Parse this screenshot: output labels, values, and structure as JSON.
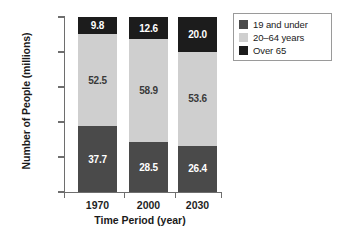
{
  "chart_data": {
    "type": "bar",
    "stacked": true,
    "title": "",
    "xlabel": "Time Period (year)",
    "ylabel": "Number of People (millions)",
    "categories": [
      "1970",
      "2000",
      "2030"
    ],
    "ylim": [
      0,
      100
    ],
    "yticks": [
      "0.0",
      "20.0",
      "40.0",
      "60.0",
      "80.0",
      "100.0"
    ],
    "ytick_values": [
      0,
      20,
      40,
      60,
      80,
      100
    ],
    "grid": false,
    "legend_position": "top-right",
    "series": [
      {
        "name": "19 and under",
        "color": "#4a4a4a",
        "label_color": "#ffffff",
        "values": [
          37.7,
          28.5,
          26.4
        ],
        "labels": [
          "37.7",
          "28.5",
          "26.4"
        ]
      },
      {
        "name": "20–64 years",
        "color": "#cfcfcf",
        "label_color": "#3a3a3a",
        "values": [
          52.5,
          58.9,
          53.6
        ],
        "labels": [
          "52.5",
          "58.9",
          "53.6"
        ]
      },
      {
        "name": "Over 65",
        "color": "#1c1c1c",
        "label_color": "#ffffff",
        "values": [
          9.8,
          12.6,
          20.0
        ],
        "labels": [
          "9.8",
          "12.6",
          "20.0"
        ]
      }
    ],
    "totals": [
      100.0,
      100.0,
      100.0
    ]
  },
  "legend": {
    "items": [
      {
        "label": "19 and under",
        "color": "#4a4a4a"
      },
      {
        "label": "20–64 years",
        "color": "#cfcfcf"
      },
      {
        "label": "Over 65",
        "color": "#1c1c1c"
      }
    ]
  }
}
